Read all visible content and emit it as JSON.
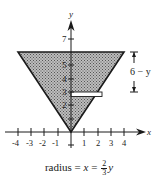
{
  "diagram": {
    "type": "cone cross-section with horizontal strip",
    "x_axis": {
      "label": "x",
      "ticks": [
        "-4",
        "-3",
        "-2",
        "-1",
        "1",
        "2",
        "3",
        "4"
      ]
    },
    "y_axis": {
      "label": "y",
      "ticks": [
        "2",
        "3",
        "4",
        "5",
        "7"
      ]
    },
    "shaded_region": "inverted triangle from (0,0) to (-4,6) and (4,6)",
    "strip": {
      "y": 3,
      "x_from": 0,
      "x_to": 2
    },
    "dimension_label": "6 − y",
    "colors": {
      "shade": "#9a9a9a",
      "ink": "#1a1a1a",
      "strip": "#ffffff"
    }
  },
  "caption": {
    "prefix": "radius = ",
    "var_x": "x",
    "eq": " = ",
    "num": "2",
    "den": "3",
    "var_y": "y"
  }
}
